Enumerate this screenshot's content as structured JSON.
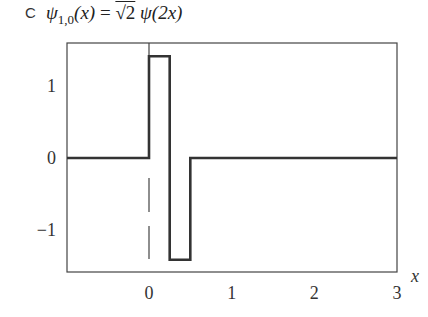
{
  "panel": {
    "label": "C"
  },
  "title": {
    "lhs": "ψ",
    "lhs_sub": "1,0",
    "lhs_arg": "(x)",
    "eq": " = ",
    "rhs_sqrt": "√2",
    "rhs_fn": " ψ(2x)"
  },
  "colors": {
    "line": "#333333",
    "frame": "#444444",
    "background": "#ffffff"
  },
  "chart_data": {
    "type": "line",
    "xlabel": "x",
    "ylabel": "",
    "xlim": [
      -1,
      3
    ],
    "ylim": [
      -1.6,
      1.6
    ],
    "xticks": [
      0,
      1,
      2,
      3
    ],
    "xtick_labels": [
      "0",
      "1",
      "2",
      "3"
    ],
    "yticks": [
      1,
      0,
      -1
    ],
    "ytick_labels": [
      "1",
      "0",
      "−1"
    ],
    "grid": false,
    "legend": null,
    "series": [
      {
        "name": "psi_1_0",
        "x": [
          -1,
          0,
          0,
          0.25,
          0.25,
          0.5,
          0.5,
          3
        ],
        "y": [
          0,
          0,
          1.414,
          1.414,
          -1.414,
          -1.414,
          0,
          0
        ]
      }
    ],
    "annotations": [
      {
        "type": "dashed-vertical-line",
        "x": 0,
        "y_range": [
          -1.6,
          0
        ]
      },
      {
        "type": "solid-vertical-line",
        "x": 0,
        "y_range": [
          0,
          1.6
        ]
      }
    ]
  }
}
